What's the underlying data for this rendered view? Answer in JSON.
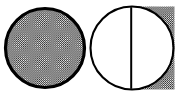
{
  "figure": {
    "title": "Two circles with halftone shading",
    "description": "Line-art diagram of two outlined circles; the left circle is entirely shaded with a halftone dot pattern, the right circle is divided by a vertical chord into an unshaded left half and a halftone-shaded right half.",
    "background_color": "#ffffff",
    "ink_color": "#000000",
    "halftone": {
      "name": "halftone-dot-pattern",
      "dot_color": "#1a1a1a",
      "field_color": "#ffffff",
      "cell_size_px": 2.1,
      "dot_radius_px": 0.62,
      "coverage_percent": 50
    },
    "canvas": {
      "width_px": 178,
      "height_px": 98
    },
    "shapes": [
      {
        "id": "left-circle",
        "name": "fully-shaded-circle",
        "center_x": 45,
        "center_y": 48,
        "radius": 39.5,
        "stroke_width_px": 3.2,
        "stroke_color": "#000000",
        "fill": "halftone",
        "shaded_fraction": 1.0,
        "label": "Full"
      },
      {
        "id": "right-circle",
        "name": "half-shaded-circle",
        "center_x": 132,
        "center_y": 48,
        "radius": 41.5,
        "stroke_width_px": 2.1,
        "stroke_color": "#000000",
        "fill": "half-halftone",
        "shaded_fraction": 0.5,
        "shaded_side": "right",
        "divider_x": 131.2,
        "divider_width_px": 2.0,
        "label": "Half"
      }
    ]
  }
}
